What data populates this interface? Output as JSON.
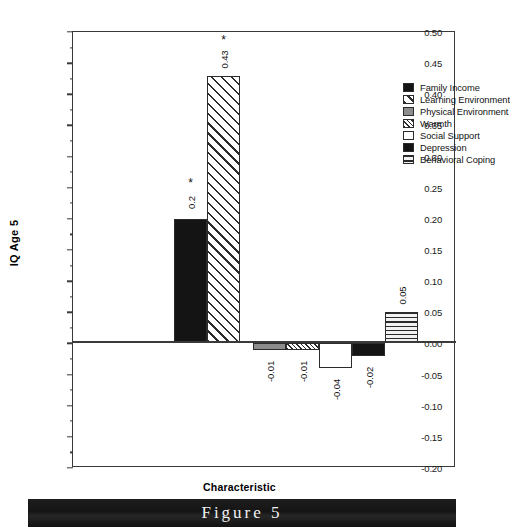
{
  "figure": {
    "caption": "Figure 5"
  },
  "chart_data": {
    "type": "bar",
    "title": "",
    "xlabel": "Characteristic",
    "ylabel": "IQ  Age 5",
    "ylim": [
      -0.2,
      0.5
    ],
    "ytick_step": 0.05,
    "grid": false,
    "legend_position": "top-right",
    "categories": [
      "Family Income",
      "Learning Environment",
      "Physical Environment",
      "Warmth",
      "Social Support",
      "Depression",
      "Behavioral Coping"
    ],
    "values": [
      0.2,
      0.43,
      -0.01,
      -0.01,
      -0.04,
      -0.02,
      0.05
    ],
    "value_labels": [
      "0.2",
      "0.43",
      "-0.01",
      "-0.01",
      "-0.04",
      "-0.02",
      "0.05"
    ],
    "significance": [
      "*",
      "*",
      "",
      "",
      "",
      "",
      ""
    ],
    "fills": [
      "solid",
      "diagonal-hatch",
      "gray",
      "dense-hatch",
      "white",
      "solid",
      "horizontal-lines"
    ],
    "ytick_labels": [
      "0.50",
      "0.45",
      "0.40",
      "0.35",
      "0.30",
      "0.25",
      "0.20",
      "0.15",
      "0.10",
      "0.05",
      "0.00",
      "-0.05",
      "-0.10",
      "-0.15",
      "-0.20"
    ],
    "ytick_values": [
      0.5,
      0.45,
      0.4,
      0.35,
      0.3,
      0.25,
      0.2,
      0.15,
      0.1,
      0.05,
      0.0,
      -0.05,
      -0.1,
      -0.15,
      -0.2
    ]
  },
  "legend": {
    "items": [
      {
        "label": "Family Income",
        "fill": "solid"
      },
      {
        "label": "Learning Environment",
        "fill": "diagonal-hatch"
      },
      {
        "label": "Physical Environment",
        "fill": "gray"
      },
      {
        "label": "Warmth",
        "fill": "dense-hatch"
      },
      {
        "label": "Social Support",
        "fill": "white"
      },
      {
        "label": "Depression",
        "fill": "solid"
      },
      {
        "label": "Behavioral Coping",
        "fill": "horizontal-lines"
      }
    ]
  },
  "colors": {
    "axis": "#3a3a3a",
    "bar_outline": "#2b2b2b",
    "solid": "#141414",
    "gray": "#8c8c8c",
    "banner_bg": "#1a1a1a",
    "banner_text": "#f2f2f2"
  }
}
